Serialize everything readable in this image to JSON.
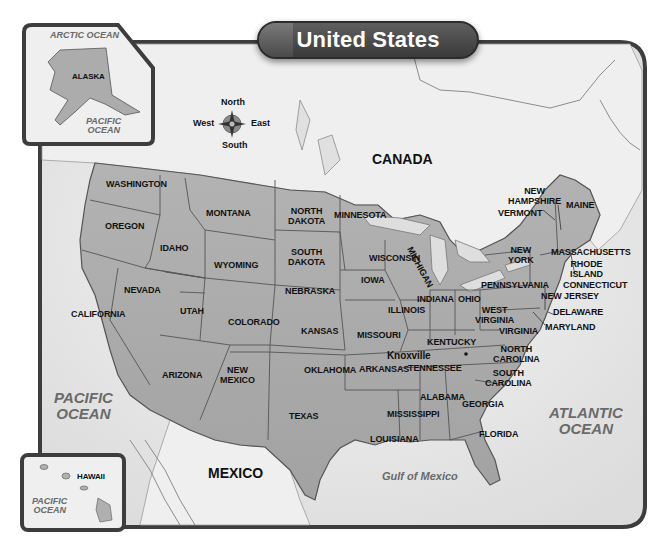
{
  "title": "United States",
  "compass": {
    "north": "North",
    "south": "South",
    "east": "East",
    "west": "West"
  },
  "insets": {
    "alaska": {
      "state": "ALASKA",
      "ocean_top": "ARCTIC OCEAN",
      "ocean_bottom_1": "PACIFIC",
      "ocean_bottom_2": "OCEAN"
    },
    "hawaii": {
      "state": "HAWAII",
      "ocean_1": "PACIFIC",
      "ocean_2": "OCEAN"
    }
  },
  "countries": {
    "canada": "CANADA",
    "mexico": "MEXICO"
  },
  "water_bodies": {
    "pacific_1": "PACIFIC",
    "pacific_2": "OCEAN",
    "atlantic_1": "ATLANTIC",
    "atlantic_2": "OCEAN",
    "gulf": "Gulf of Mexico"
  },
  "city": {
    "name": "Knoxville"
  },
  "states": {
    "washington": "WASHINGTON",
    "oregon": "OREGON",
    "california": "CALIFORNIA",
    "idaho": "IDAHO",
    "nevada": "NEVADA",
    "montana": "MONTANA",
    "wyoming": "WYOMING",
    "utah": "UTAH",
    "arizona": "ARIZONA",
    "colorado": "COLORADO",
    "new_mexico_1": "NEW",
    "new_mexico_2": "MEXICO",
    "north_dakota_1": "NORTH",
    "north_dakota_2": "DAKOTA",
    "south_dakota_1": "SOUTH",
    "south_dakota_2": "DAKOTA",
    "nebraska": "NEBRASKA",
    "kansas": "KANSAS",
    "oklahoma": "OKLAHOMA",
    "texas": "TEXAS",
    "minnesota": "MINNESOTA",
    "iowa": "IOWA",
    "missouri": "MISSOURI",
    "arkansas": "ARKANSAS",
    "louisiana": "LOUISIANA",
    "wisconsin": "WISCONSIN",
    "illinois": "ILLINOIS",
    "michigan": "MICHIGAN",
    "indiana": "INDIANA",
    "ohio": "OHIO",
    "kentucky": "KENTUCKY",
    "tennessee": "TENNESSEE",
    "mississippi": "MISSISSIPPI",
    "alabama": "ALABAMA",
    "georgia": "GEORGIA",
    "florida": "FLORIDA",
    "south_carolina_1": "SOUTH",
    "south_carolina_2": "CAROLINA",
    "north_carolina_1": "NORTH",
    "north_carolina_2": "CAROLINA",
    "virginia": "VIRGINIA",
    "west_virginia_1": "WEST",
    "west_virginia_2": "VIRGINIA",
    "pennsylvania": "PENNSYLVANIA",
    "new_york_1": "NEW",
    "new_york_2": "YORK",
    "vermont": "VERMONT",
    "new_hampshire_1": "NEW",
    "new_hampshire_2": "HAMPSHIRE",
    "maine": "MAINE",
    "massachusetts": "MASSACHUSETTS",
    "rhode_island_1": "RHODE",
    "rhode_island_2": "ISLAND",
    "connecticut": "CONNECTICUT",
    "new_jersey": "NEW JERSEY",
    "delaware": "DELAWARE",
    "maryland": "MARYLAND"
  },
  "colors": {
    "land_us": "#a9a9a9",
    "land_other": "#ececec",
    "water": "#e4e4e4",
    "frame": "#3d3d3d",
    "title_bg": "#4a4a4a"
  }
}
